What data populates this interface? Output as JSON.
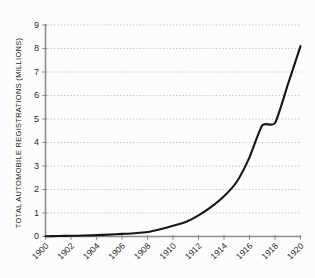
{
  "chart_data": {
    "type": "line",
    "title": "",
    "xlabel": "",
    "ylabel": "TOTAL AUTOMOBILE REGISTRATIONS (MILLIONS)",
    "xlim": [
      1900,
      1920
    ],
    "ylim": [
      0,
      9
    ],
    "grid": true,
    "legend": "none",
    "x_tick_labels": [
      "1900",
      "1902",
      "1904",
      "1906",
      "1908",
      "1910",
      "1912",
      "1914",
      "1916",
      "1918",
      "1920"
    ],
    "x_tick_values": [
      1900,
      1902,
      1904,
      1906,
      1908,
      1910,
      1912,
      1914,
      1916,
      1918,
      1920
    ],
    "y_tick_labels": [
      "0",
      "1",
      "2",
      "3",
      "4",
      "5",
      "6",
      "7",
      "8",
      "9"
    ],
    "y_tick_values": [
      0,
      1,
      2,
      3,
      4,
      5,
      6,
      7,
      8,
      9
    ],
    "series": [
      {
        "name": "Total automobile registrations",
        "color": "#161616",
        "x": [
          1900,
          1901,
          1902,
          1903,
          1904,
          1905,
          1906,
          1907,
          1908,
          1909,
          1910,
          1911,
          1912,
          1913,
          1914,
          1915,
          1916,
          1917,
          1918,
          1919,
          1920
        ],
        "values": [
          0.01,
          0.02,
          0.03,
          0.04,
          0.06,
          0.08,
          0.11,
          0.14,
          0.19,
          0.31,
          0.46,
          0.62,
          0.9,
          1.26,
          1.71,
          2.33,
          3.37,
          4.73,
          4.83,
          6.45,
          8.1
        ]
      }
    ]
  },
  "axes": {
    "y_axis_title": "TOTAL AUTOMOBILE REGISTRATIONS (MILLIONS)"
  },
  "colors": {
    "curve": "#161616",
    "axis": "#8d8d8d",
    "grid": "#b9b9b9",
    "background": "#fcfcfc",
    "text": "#2a2a2a"
  }
}
